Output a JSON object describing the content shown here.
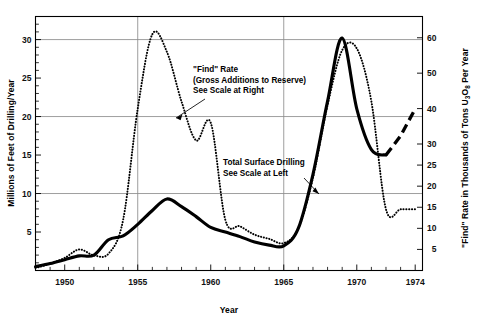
{
  "chart_data": {
    "type": "line",
    "title": "",
    "xlabel": "Year",
    "ylabel": "Millions of Feet of Drilling/Year",
    "y2label": "\"Find\" Rate in Thousands of Tons U₃O₈ Per Year",
    "xlim": [
      1948,
      1974.5
    ],
    "ylim": [
      0,
      33
    ],
    "y2lim": [
      0,
      66
    ],
    "grid": true,
    "legend_position": "inline-annotations",
    "xticks": [
      1950,
      1955,
      1960,
      1965,
      1970,
      1974
    ],
    "xtick_labels": [
      "1950",
      "1955",
      "1960",
      "1965",
      "1970",
      "1974"
    ],
    "xticks_minor": [
      1948,
      1949,
      1951,
      1952,
      1953,
      1954,
      1956,
      1957,
      1958,
      1959,
      1961,
      1962,
      1963,
      1964,
      1966,
      1967,
      1968,
      1969,
      1971,
      1972,
      1973
    ],
    "yticks": [
      5,
      10,
      15,
      20,
      25,
      30
    ],
    "ytick_labels": [
      "5",
      "10",
      "15",
      "20",
      "25",
      "30"
    ],
    "yticks_minor": [
      1,
      2,
      3,
      4,
      6,
      7,
      8,
      9,
      11,
      12,
      13,
      14,
      16,
      17,
      18,
      19,
      21,
      22,
      23,
      24,
      26,
      27,
      28,
      29,
      31,
      32
    ],
    "y2ticks": [
      5,
      10,
      15,
      20,
      25,
      30,
      40,
      50,
      60
    ],
    "y2tick_labels": [
      "5",
      "10",
      "15",
      "20",
      "25",
      "30",
      "40",
      "50",
      "60"
    ],
    "gridlines_y": [
      10,
      20,
      30
    ],
    "gridlines_x": [
      1955,
      1965
    ],
    "series": [
      {
        "name": "Total Surface Drilling",
        "style": "solid",
        "axis": "left",
        "unit": "Millions of Feet of Drilling/Year",
        "x": [
          1948,
          1949,
          1950,
          1951,
          1952,
          1953,
          1954,
          1955,
          1956,
          1957,
          1958,
          1959,
          1960,
          1961,
          1962,
          1963,
          1964,
          1965,
          1966,
          1967,
          1968,
          1969,
          1970,
          1971,
          1972
        ],
        "values": [
          0.5,
          0.9,
          1.4,
          1.9,
          2.0,
          4.0,
          4.5,
          6.0,
          7.8,
          9.3,
          8.3,
          7.0,
          5.6,
          5.0,
          4.4,
          3.7,
          3.3,
          3.2,
          5.5,
          12.5,
          22.0,
          30.2,
          21.0,
          15.7,
          15.0
        ]
      },
      {
        "name": "Total Surface Drilling (projection)",
        "style": "dashed",
        "axis": "left",
        "unit": "Millions of Feet of Drilling/Year",
        "x": [
          1972,
          1973,
          1974
        ],
        "values": [
          15.0,
          17.5,
          21.0
        ]
      },
      {
        "name": "\"Find\" Rate (Gross Additions to Reserve)",
        "style": "dotted",
        "axis": "right",
        "unit": "Thousands of Tons U3O8 Per Year",
        "x": [
          1948,
          1949,
          1950,
          1951,
          1952,
          1953,
          1954,
          1955,
          1956,
          1957,
          1958,
          1959,
          1960,
          1961,
          1962,
          1963,
          1964,
          1965,
          1966,
          1967,
          1968,
          1969,
          1970,
          1971,
          1972,
          1973,
          1974
        ],
        "values": [
          0.6,
          1.6,
          3.0,
          5.0,
          3.6,
          4.0,
          12.0,
          40.0,
          61.0,
          56.0,
          42.0,
          31.0,
          36.0,
          12.0,
          10.5,
          8.5,
          7.5,
          6.5,
          10.0,
          22.0,
          41.0,
          56.5,
          57.0,
          42.0,
          14.5,
          14.5,
          14.5
        ]
      }
    ],
    "annotations": [
      {
        "name": "find-rate-annotation",
        "lines": [
          "\"Find\" Rate",
          "(Gross Additions to Reserve)",
          "See Scale at Right"
        ],
        "points_to": "dotted-curve"
      },
      {
        "name": "total-surface-drilling-annotation",
        "lines": [
          "Total Surface Drilling",
          "See Scale at Left"
        ],
        "points_to": "solid-curve"
      }
    ]
  },
  "axes": {
    "left_title": "Millions of Feet of Drilling/Year",
    "right_title_parts": {
      "prefix": "\"Find\" Rate in Thousands of Tons U",
      "sub1": "3",
      "mid": "O",
      "sub2": "8",
      "suffix": " Per Year"
    },
    "x_title": "Year"
  },
  "annotations": {
    "find_rate": {
      "line1": "\"Find\" Rate",
      "line2": "(Gross Additions to Reserve)",
      "line3": "See Scale at Right"
    },
    "drilling": {
      "line1": "Total Surface Drilling",
      "line2": "See Scale at Left"
    }
  },
  "colors": {
    "ink": "#000000",
    "grid": "#8d8d8d",
    "background": "#ffffff"
  }
}
